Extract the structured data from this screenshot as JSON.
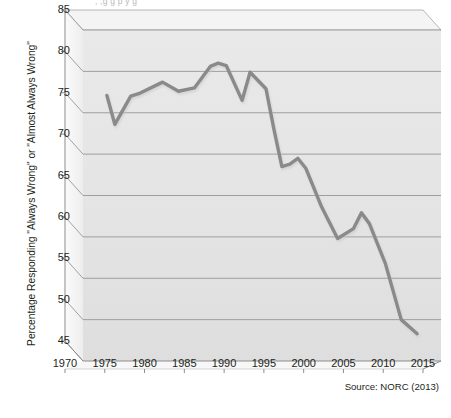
{
  "title_cropped": ",  ,g   g  p          y   g",
  "y_axis": {
    "label": "Percentage Responding \"Always Wrong\" or \"Almost Always Wrong\"",
    "ticks": [
      "45",
      "50",
      "55",
      "60",
      "65",
      "70",
      "75",
      "80",
      "85"
    ]
  },
  "x_axis": {
    "label": "",
    "ticks": [
      "1970",
      "1975",
      "1980",
      "1985",
      "1990",
      "1995",
      "2000",
      "2005",
      "2010",
      "2015"
    ]
  },
  "source": "Source: NORC (2013)",
  "colors": {
    "line": "#8a8a8a",
    "plot_background": "#e6e6e6",
    "gridline": "#8d8d8d",
    "axis": "#8d8d8d",
    "text": "#231f20"
  },
  "chart_data": {
    "type": "line",
    "title": "",
    "xlabel": "",
    "ylabel": "Percentage Responding \"Always Wrong\" or \"Almost Always Wrong\"",
    "xlim": [
      1970,
      2015
    ],
    "ylim": [
      45,
      85
    ],
    "ytick_step": 5,
    "xtick_step": 5,
    "grid": "horizontal",
    "legend": "none",
    "source": "Source: NORC (2013)",
    "series": [
      {
        "name": "Percentage Responding \"Always Wrong\" or \"Almost Always Wrong\"",
        "color": "#8a8a8a",
        "x": [
          1973,
          1974,
          1976,
          1977,
          1980,
          1982,
          1984,
          1985,
          1986,
          1987,
          1988,
          1990,
          1991,
          1993,
          1994,
          1995,
          1996,
          1997,
          1998,
          2000,
          2002,
          2004,
          2005,
          2006,
          2008,
          2010,
          2012
        ],
        "y": [
          77.1,
          73.6,
          77.0,
          77.3,
          78.7,
          77.6,
          78.0,
          79.3,
          80.6,
          81.0,
          80.7,
          76.5,
          79.9,
          77.9,
          73.0,
          68.5,
          68.8,
          69.5,
          68.3,
          63.6,
          59.8,
          61.0,
          62.9,
          61.6,
          56.8,
          50.0,
          48.3
        ]
      }
    ]
  }
}
